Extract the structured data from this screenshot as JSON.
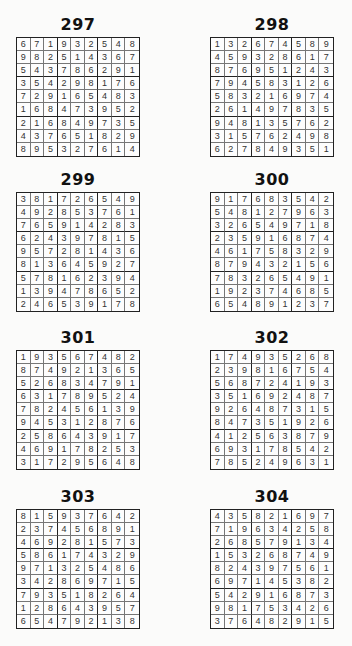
{
  "puzzles": [
    {
      "number": "297",
      "grid": [
        [
          6,
          7,
          1,
          9,
          3,
          2,
          5,
          4,
          8
        ],
        [
          9,
          8,
          2,
          5,
          1,
          4,
          3,
          6,
          7
        ],
        [
          5,
          4,
          3,
          7,
          8,
          6,
          2,
          9,
          1
        ],
        [
          3,
          5,
          4,
          2,
          9,
          8,
          1,
          7,
          6
        ],
        [
          7,
          2,
          9,
          1,
          6,
          5,
          4,
          8,
          3
        ],
        [
          1,
          6,
          8,
          4,
          7,
          3,
          9,
          5,
          2
        ],
        [
          2,
          1,
          6,
          8,
          4,
          9,
          7,
          3,
          5
        ],
        [
          4,
          3,
          7,
          6,
          5,
          1,
          8,
          2,
          9
        ],
        [
          8,
          9,
          5,
          3,
          2,
          7,
          6,
          1,
          4
        ]
      ]
    },
    {
      "number": "298",
      "grid": [
        [
          1,
          3,
          2,
          6,
          7,
          4,
          5,
          8,
          9
        ],
        [
          4,
          5,
          9,
          3,
          2,
          8,
          6,
          1,
          7
        ],
        [
          8,
          7,
          6,
          9,
          5,
          1,
          2,
          4,
          3
        ],
        [
          7,
          9,
          4,
          5,
          8,
          3,
          1,
          2,
          6
        ],
        [
          5,
          8,
          3,
          2,
          1,
          6,
          9,
          7,
          4
        ],
        [
          2,
          6,
          1,
          4,
          9,
          7,
          8,
          3,
          5
        ],
        [
          9,
          4,
          8,
          1,
          3,
          5,
          7,
          6,
          2
        ],
        [
          3,
          1,
          5,
          7,
          6,
          2,
          4,
          9,
          8
        ],
        [
          6,
          2,
          7,
          8,
          4,
          9,
          3,
          5,
          1
        ]
      ]
    },
    {
      "number": "299",
      "grid": [
        [
          3,
          8,
          1,
          7,
          2,
          6,
          5,
          4,
          9
        ],
        [
          4,
          9,
          2,
          8,
          5,
          3,
          7,
          6,
          1
        ],
        [
          7,
          6,
          5,
          9,
          1,
          4,
          2,
          8,
          3
        ],
        [
          6,
          2,
          4,
          3,
          9,
          7,
          8,
          1,
          5
        ],
        [
          9,
          5,
          7,
          2,
          8,
          1,
          4,
          3,
          6
        ],
        [
          8,
          1,
          3,
          6,
          4,
          5,
          9,
          2,
          7
        ],
        [
          5,
          7,
          8,
          1,
          6,
          2,
          3,
          9,
          4
        ],
        [
          1,
          3,
          9,
          4,
          7,
          8,
          6,
          5,
          2
        ],
        [
          2,
          4,
          6,
          5,
          3,
          9,
          1,
          7,
          8
        ]
      ]
    },
    {
      "number": "300",
      "grid": [
        [
          9,
          1,
          7,
          6,
          8,
          3,
          5,
          4,
          2
        ],
        [
          5,
          4,
          8,
          1,
          2,
          7,
          9,
          6,
          3
        ],
        [
          3,
          2,
          6,
          5,
          4,
          9,
          7,
          1,
          8
        ],
        [
          2,
          3,
          5,
          9,
          1,
          6,
          8,
          7,
          4
        ],
        [
          4,
          6,
          1,
          7,
          5,
          8,
          3,
          2,
          9
        ],
        [
          8,
          7,
          9,
          4,
          3,
          2,
          1,
          5,
          6
        ],
        [
          7,
          8,
          3,
          2,
          6,
          5,
          4,
          9,
          1
        ],
        [
          1,
          9,
          2,
          3,
          7,
          4,
          6,
          8,
          5
        ],
        [
          6,
          5,
          4,
          8,
          9,
          1,
          2,
          3,
          7
        ]
      ]
    },
    {
      "number": "301",
      "grid": [
        [
          1,
          9,
          3,
          5,
          6,
          7,
          4,
          8,
          2
        ],
        [
          8,
          7,
          4,
          9,
          2,
          1,
          3,
          6,
          5
        ],
        [
          5,
          2,
          6,
          8,
          3,
          4,
          7,
          9,
          1
        ],
        [
          6,
          3,
          1,
          7,
          8,
          9,
          5,
          2,
          4
        ],
        [
          7,
          8,
          2,
          4,
          5,
          6,
          1,
          3,
          9
        ],
        [
          9,
          4,
          5,
          3,
          1,
          2,
          8,
          7,
          6
        ],
        [
          2,
          5,
          8,
          6,
          4,
          3,
          9,
          1,
          7
        ],
        [
          4,
          6,
          9,
          1,
          7,
          8,
          2,
          5,
          3
        ],
        [
          3,
          1,
          7,
          2,
          9,
          5,
          6,
          4,
          8
        ]
      ]
    },
    {
      "number": "302",
      "grid": [
        [
          1,
          7,
          4,
          9,
          3,
          5,
          2,
          6,
          8
        ],
        [
          2,
          3,
          9,
          8,
          1,
          6,
          7,
          5,
          4
        ],
        [
          5,
          6,
          8,
          7,
          2,
          4,
          1,
          9,
          3
        ],
        [
          3,
          5,
          1,
          6,
          9,
          2,
          4,
          8,
          7
        ],
        [
          9,
          2,
          6,
          4,
          8,
          7,
          3,
          1,
          5
        ],
        [
          8,
          4,
          7,
          3,
          5,
          1,
          9,
          2,
          6
        ],
        [
          4,
          1,
          2,
          5,
          6,
          3,
          8,
          7,
          9
        ],
        [
          6,
          9,
          3,
          1,
          7,
          8,
          5,
          4,
          2
        ],
        [
          7,
          8,
          5,
          2,
          4,
          9,
          6,
          3,
          1
        ]
      ]
    },
    {
      "number": "303",
      "grid": [
        [
          8,
          1,
          5,
          9,
          3,
          7,
          6,
          4,
          2
        ],
        [
          2,
          3,
          7,
          4,
          5,
          6,
          8,
          9,
          1
        ],
        [
          4,
          6,
          9,
          2,
          8,
          1,
          5,
          7,
          3
        ],
        [
          5,
          8,
          6,
          1,
          7,
          4,
          3,
          2,
          9
        ],
        [
          9,
          7,
          1,
          3,
          2,
          5,
          4,
          8,
          6
        ],
        [
          3,
          4,
          2,
          8,
          6,
          9,
          7,
          1,
          5
        ],
        [
          7,
          9,
          3,
          5,
          1,
          8,
          2,
          6,
          4
        ],
        [
          1,
          2,
          8,
          6,
          4,
          3,
          9,
          5,
          7
        ],
        [
          6,
          5,
          4,
          7,
          9,
          2,
          1,
          3,
          8
        ]
      ]
    },
    {
      "number": "304",
      "grid": [
        [
          4,
          3,
          5,
          8,
          2,
          1,
          6,
          9,
          7
        ],
        [
          7,
          1,
          9,
          6,
          3,
          4,
          2,
          5,
          8
        ],
        [
          2,
          6,
          8,
          5,
          7,
          9,
          1,
          3,
          4
        ],
        [
          1,
          5,
          3,
          2,
          6,
          8,
          7,
          4,
          9
        ],
        [
          8,
          2,
          4,
          3,
          9,
          7,
          5,
          6,
          1
        ],
        [
          6,
          9,
          7,
          1,
          4,
          5,
          3,
          8,
          2
        ],
        [
          5,
          4,
          2,
          9,
          1,
          6,
          8,
          7,
          3
        ],
        [
          9,
          8,
          1,
          7,
          5,
          3,
          4,
          2,
          6
        ],
        [
          3,
          7,
          6,
          4,
          8,
          2,
          9,
          1,
          5
        ]
      ]
    }
  ]
}
